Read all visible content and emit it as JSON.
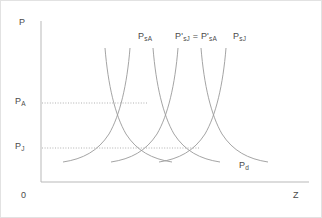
{
  "figure": {
    "background": "#ffffff",
    "border_color": "#e2e2e2"
  },
  "axes": {
    "y_axis_label": "P",
    "x_axis_label": "Z",
    "origin_label": "0",
    "axis_color": "#b9b9b9",
    "y_ticks": [
      {
        "id": "pa",
        "label_main": "P",
        "label_sub": "A",
        "y": 102
      },
      {
        "id": "pj",
        "label_main": "P",
        "label_sub": "J",
        "y": 147
      }
    ]
  },
  "curve_labels": [
    {
      "id": "psA",
      "text": "P<sub>sA</sub>"
    },
    {
      "id": "pjpa",
      "text": "P'<sub>sJ</sub> = P'<sub>sA</sub>"
    },
    {
      "id": "psJ",
      "text": "P<sub>sJ</sub>"
    },
    {
      "id": "pd",
      "text": "P<sub>d</sub>"
    }
  ],
  "guide_lines": [
    {
      "id": "pa-guide",
      "y": 102,
      "x_start": 41,
      "x_end": 146,
      "style": "dotted"
    },
    {
      "id": "pj-guide",
      "y": 147,
      "x_start": 41,
      "x_end": 198,
      "style": "dotted"
    }
  ],
  "chart_data": {
    "type": "line",
    "title": "",
    "xlabel": "Z",
    "ylabel": "P",
    "grid": false,
    "legend": "inline-curve-labels",
    "curve_color": "#9a9a9a",
    "xlim": [
      0,
      322
    ],
    "ylim": [
      0,
      218
    ],
    "series": [
      {
        "name": "P_sA",
        "role": "supply",
        "label": "P<sub>sA</sub>",
        "label_x": 137,
        "label_y": 31,
        "path": "M 148,46 C 144,78 138,104 128,124 C 118,143 102,154 83,160"
      },
      {
        "name": "P'_sJ = P'_sA",
        "role": "supply",
        "label": "P'<sub>sJ</sub> = P'<sub>sA</sub>",
        "label_x": 174,
        "label_y": 31,
        "path": "M 196,46 C 192,78 186,104 176,124 C 166,143 150,154 131,160"
      },
      {
        "name": "P_sJ",
        "role": "supply",
        "label": "P<sub>sJ</sub>",
        "label_x": 232,
        "label_y": 31,
        "path": "M 244,46 C 240,78 234,104 224,124 C 214,143 198,154 179,160"
      },
      {
        "name": "P_d (left)",
        "role": "demand",
        "label": "",
        "path": "M 112,46 C 116,78 122,104 132,124 C 142,143 158,154 177,160"
      },
      {
        "name": "P_d (middle)",
        "role": "demand",
        "label": "",
        "path": "M 160,46 C 164,78 170,104 180,124 C 190,143 206,154 225,160"
      },
      {
        "name": "P_d",
        "role": "demand",
        "label": "P<sub>d</sub>",
        "label_x": 238,
        "label_y": 160,
        "path": "M 64,160 C 84,154 100,143 110,124 C 120,104 126,78 130,46"
      }
    ],
    "intersections": [
      {
        "id": "A",
        "x": 146,
        "y": 102,
        "price_label": "P_A"
      },
      {
        "id": "J",
        "x": 198,
        "y": 147,
        "price_label": "P_J"
      }
    ]
  }
}
